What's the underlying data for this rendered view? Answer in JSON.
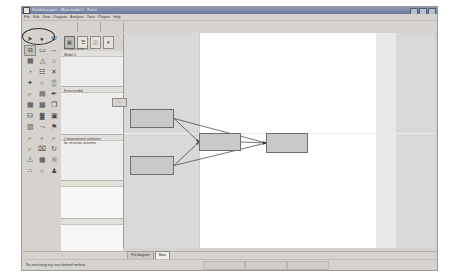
{
  "window": {
    "title": "Untitled project - Main model 1 : Event",
    "title_icon": "app-icon",
    "buttons": [
      "minimize",
      "maximize",
      "close"
    ]
  },
  "menu": {
    "items": [
      "File",
      "Edit",
      "View",
      "Diagram",
      "Analysis",
      "Tools",
      "Plugins",
      "Help"
    ]
  },
  "toolbar_top": {
    "icons": [
      "new-document-icon",
      "open-folder-icon",
      "save-icon",
      "print-icon",
      "cut-icon",
      "copy-icon",
      "paste-icon",
      "undo-icon",
      "redo-icon"
    ]
  },
  "palette": {
    "selected_index": 3,
    "annotation": "ellipse-highlight",
    "tools": [
      {
        "name": "pointer-tool",
        "glyph": "➤"
      },
      {
        "name": "pan-tool",
        "glyph": "●"
      },
      {
        "name": "connector-tool",
        "glyph": "Ψ"
      },
      {
        "name": "event-shape-tool",
        "glyph": "⧉"
      },
      {
        "name": "function-shape-tool",
        "glyph": "▭"
      },
      {
        "name": "link-tool",
        "glyph": "↔"
      },
      {
        "name": "process-tool",
        "glyph": "▦"
      },
      {
        "name": "org-unit-tool",
        "glyph": "△"
      },
      {
        "name": "role-tool",
        "glyph": "⌂"
      },
      {
        "name": "data-store-tool",
        "glyph": "◔"
      },
      {
        "name": "cluster-tool",
        "glyph": "☷"
      },
      {
        "name": "delete-tool",
        "glyph": "✕"
      },
      {
        "name": "arrow-up-tool",
        "glyph": "✦"
      },
      {
        "name": "circle-tool",
        "glyph": "○"
      },
      {
        "name": "grid-tool",
        "glyph": "▒"
      },
      {
        "name": "zoom-tool",
        "glyph": "⌕"
      },
      {
        "name": "dim-tool",
        "glyph": "▤"
      },
      {
        "name": "pencil-tool",
        "glyph": "✒"
      },
      {
        "name": "table-tool",
        "glyph": "▦"
      },
      {
        "name": "matrix-tool",
        "glyph": "▩"
      },
      {
        "name": "layers-tool",
        "glyph": "❐"
      },
      {
        "name": "database-tool",
        "glyph": "⛁"
      },
      {
        "name": "chart-tool",
        "glyph": "▓"
      },
      {
        "name": "save-view-tool",
        "glyph": "▣"
      },
      {
        "name": "report-tool",
        "glyph": "▥"
      },
      {
        "name": "flow-tool",
        "glyph": "⤳"
      },
      {
        "name": "flag-tool",
        "glyph": "⚑"
      },
      {
        "name": "search-small-tool",
        "glyph": "⌕"
      },
      {
        "name": "search-plus-tool",
        "glyph": "⌕"
      },
      {
        "name": "search-minus-tool",
        "glyph": "⌕"
      },
      {
        "name": "magnify-tool",
        "glyph": "⌕"
      },
      {
        "name": "image-tool",
        "glyph": "⌧"
      },
      {
        "name": "rotate-tool",
        "glyph": "↻"
      },
      {
        "name": "warning-tool",
        "glyph": "⚠"
      },
      {
        "name": "calendar-tool",
        "glyph": "▦"
      },
      {
        "name": "attach-tool",
        "glyph": "⎘"
      },
      {
        "name": "dots-tool",
        "glyph": "∴"
      },
      {
        "name": "circle2-tool",
        "glyph": "○"
      },
      {
        "name": "people-tool",
        "glyph": "♟"
      }
    ]
  },
  "left_panel": {
    "header_icons": [
      "tree-view-icon",
      "list-view-icon",
      "properties-icon",
      "filter-icon"
    ],
    "caption": "Group number 1",
    "sections": [
      {
        "name": "section-model",
        "label": "Model 1",
        "height": 36
      },
      {
        "name": "section-event",
        "label": "Event model",
        "height": 48
      },
      {
        "name": "section-properties",
        "label": "Computational attributes\nfor structure activities",
        "height": 46
      },
      {
        "name": "section-empty-1",
        "label": "",
        "height": 38
      },
      {
        "name": "section-empty-2",
        "label": "",
        "height": 38
      }
    ],
    "float_button_label": "..."
  },
  "canvas": {
    "diagram_nodes": [
      {
        "name": "node-top-left",
        "label": "",
        "x": 6,
        "y": 76,
        "w": 44,
        "h": 19
      },
      {
        "name": "node-bottom-left",
        "label": "",
        "x": 6,
        "y": 123,
        "w": 44,
        "h": 19
      },
      {
        "name": "node-middle",
        "label": "",
        "x": 75,
        "y": 100,
        "w": 42,
        "h": 18
      },
      {
        "name": "node-right",
        "label": "",
        "x": 142,
        "y": 100,
        "w": 42,
        "h": 20
      }
    ],
    "connections": [
      {
        "from": "node-top-left",
        "to": "node-middle"
      },
      {
        "from": "node-top-left",
        "to": "node-right"
      },
      {
        "from": "node-bottom-left",
        "to": "node-middle"
      },
      {
        "from": "node-bottom-left",
        "to": "node-right"
      },
      {
        "from": "node-middle",
        "to": "node-right"
      }
    ]
  },
  "tabs": {
    "items": [
      {
        "name": "tab-full-diagram",
        "label": "Full diagram",
        "active": false
      },
      {
        "name": "tab-main",
        "label": "Main",
        "active": true
      }
    ]
  },
  "status": {
    "message": "No simulating any user-defined method",
    "cells": [
      "",
      "",
      ""
    ]
  },
  "colors": {
    "title_bar": "#6e7a9c",
    "chrome": "#d6d3ce",
    "canvas_bg": "#d9d9d9",
    "page_bg": "#ffffff",
    "node_fill": "#c9c9c9",
    "node_stroke": "#6e6e6e",
    "annotation": "#2c2c2c"
  }
}
